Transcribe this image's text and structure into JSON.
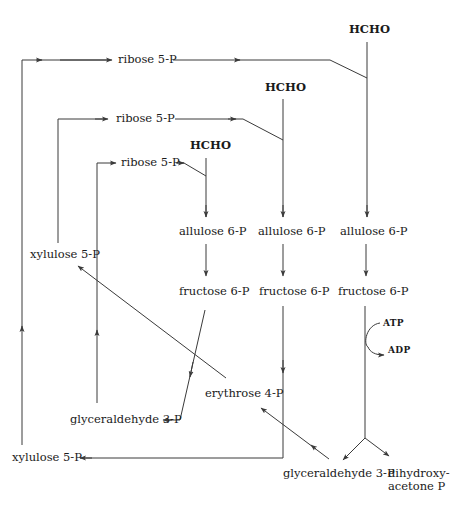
{
  "diagram": {
    "title": "",
    "nodes": {
      "hcho_1": "HCHO",
      "hcho_2": "HCHO",
      "hcho_3": "HCHO",
      "ribose_top": "ribose 5-P",
      "ribose_mid": "ribose 5-P",
      "ribose_low": "ribose 5-P",
      "allulose_1": "allulose 6-P",
      "allulose_2": "allulose 6-P",
      "allulose_3": "allulose 6-P",
      "fructose_1": "fructose 6-P",
      "fructose_2": "fructose 6-P",
      "fructose_3": "fructose 6-P",
      "xylulose_upper": "xylulose 5-P",
      "xylulose_lower": "xylulose 5-P",
      "erythrose": "erythrose 4-P",
      "glyceraldehyde_left": "glyceraldehyde 3-P",
      "glyceraldehyde_right": "glyceraldehyde 3-P",
      "dihydroxyacetone": "dihydroxy-\nacetone P",
      "atp": "ATP",
      "adp": "ADP"
    },
    "edges": [
      {
        "from": "ribose_low",
        "to": "allulose_1",
        "via": "HCHO (1)"
      },
      {
        "from": "ribose_mid",
        "to": "allulose_2",
        "via": "HCHO (2)"
      },
      {
        "from": "ribose_top",
        "to": "allulose_3",
        "via": "HCHO (3)"
      },
      {
        "from": "allulose_1",
        "to": "fructose_1"
      },
      {
        "from": "allulose_2",
        "to": "fructose_2"
      },
      {
        "from": "allulose_3",
        "to": "fructose_3"
      },
      {
        "from": "fructose_1",
        "to": "glyceraldehyde_left"
      },
      {
        "from": "fructose_2",
        "to": "xylulose_lower"
      },
      {
        "from": "fructose_3",
        "to": "glyceraldehyde_right",
        "cofactor": "ATP -> ADP"
      },
      {
        "from": "fructose_3",
        "to": "dihydroxyacetone"
      },
      {
        "from": "glyceraldehyde_right",
        "to": "erythrose"
      },
      {
        "from": "erythrose",
        "to": "xylulose_upper"
      },
      {
        "from": "glyceraldehyde_left",
        "to": "ribose_low"
      },
      {
        "from": "xylulose_upper",
        "to": "ribose_mid"
      },
      {
        "from": "xylulose_lower",
        "to": "ribose_top"
      }
    ]
  }
}
